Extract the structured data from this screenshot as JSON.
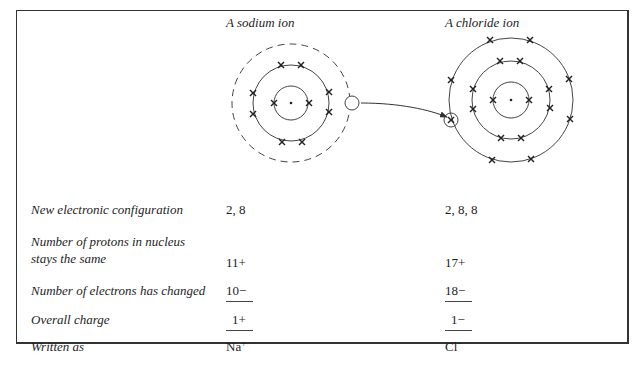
{
  "columns": {
    "sodium": {
      "title": "A sodium ion",
      "shells": [
        2,
        8
      ],
      "removed_outer_shell": true,
      "transferred_electron_marker": "empty-circle"
    },
    "chloride": {
      "title": "A chloride ion",
      "shells": [
        2,
        8,
        8
      ],
      "gained_electron_marker": "circled-x"
    }
  },
  "arrow": {
    "from": "sodium-outer-electron",
    "to": "chloride-gained-electron"
  },
  "rows": [
    {
      "label": "New electronic configuration",
      "sodium": "2, 8",
      "chloride": "2, 8, 8"
    },
    {
      "label_line1": "Number of protons in nucleus",
      "label_line2": "stays the same",
      "sodium": "11+",
      "chloride": "17+"
    },
    {
      "label": "Number of electrons has changed",
      "sodium": "10−",
      "chloride": "18−"
    },
    {
      "label": "Overall charge",
      "sodium": "1+",
      "chloride": "1−"
    },
    {
      "label": "Written as",
      "sodium_symbol": "Na",
      "sodium_charge": "+",
      "chloride_symbol": "Cl",
      "chloride_charge": "−"
    }
  ],
  "colors": {
    "line": "#333333",
    "text": "#1e1e1e",
    "background": "#ffffff"
  }
}
